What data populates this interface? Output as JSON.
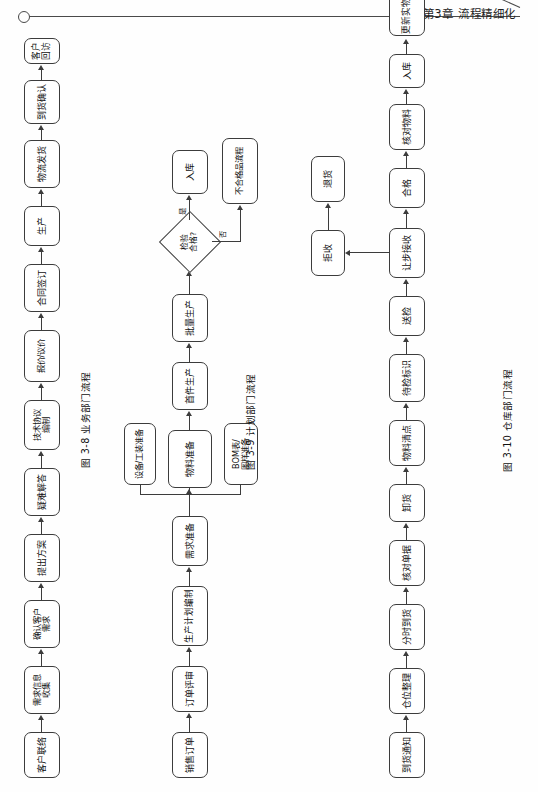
{
  "header": {
    "chapter_title": "第3章  流程精细化",
    "ornament_icon": "circle-ornament-icon",
    "rule_icon": "header-rule-icon"
  },
  "figures": [
    {
      "id": "fig-3-8",
      "caption": "图 3-8   业务部门流程",
      "caption_number": "图 3-8",
      "caption_name": "业务部门流程",
      "nodes": [
        {
          "key": "n1",
          "label": "客户联络"
        },
        {
          "key": "n2",
          "label": "需求信息\n收集"
        },
        {
          "key": "n3",
          "label": "确认客户\n需求"
        },
        {
          "key": "n4",
          "label": "提出方案"
        },
        {
          "key": "n5",
          "label": "疑难解答"
        },
        {
          "key": "n6",
          "label": "技术协议\n编制"
        },
        {
          "key": "n7",
          "label": "报价/议价"
        },
        {
          "key": "n8",
          "label": "合同签订"
        },
        {
          "key": "n9",
          "label": "生产"
        },
        {
          "key": "n10",
          "label": "物流发货"
        },
        {
          "key": "n11",
          "label": "到货确认"
        },
        {
          "key": "n12",
          "label": "客户回访"
        }
      ]
    },
    {
      "id": "fig-3-9",
      "caption": "图 3-9   计划部门流程",
      "caption_number": "图 3-9",
      "caption_name": "计划部门流程",
      "nodes": [
        {
          "key": "m1",
          "label": "销售订单"
        },
        {
          "key": "m2",
          "label": "订单评审"
        },
        {
          "key": "m3",
          "label": "生产计划编制"
        },
        {
          "key": "m4",
          "label": "需求准备"
        },
        {
          "key": "m5",
          "label": "物料准备"
        },
        {
          "key": "m6",
          "label": "设备/工装准备"
        },
        {
          "key": "m7",
          "label": "BOM表/\n图样准备"
        },
        {
          "key": "m8",
          "label": "首件生产"
        },
        {
          "key": "m9",
          "label": "批量生产"
        },
        {
          "key": "m10",
          "label": "入库"
        },
        {
          "key": "m11",
          "label": "不合格品流程"
        }
      ],
      "decision": {
        "key": "d1",
        "label": "检验\n合格?"
      },
      "edge_labels": {
        "yes": "是",
        "no": "否"
      }
    },
    {
      "id": "fig-3-10",
      "caption": "图 3-10   仓库部门流程",
      "caption_number": "图 3-10",
      "caption_name": "仓库部门流程",
      "nodes": [
        {
          "key": "w1",
          "label": "到货通知"
        },
        {
          "key": "w2",
          "label": "仓位整理"
        },
        {
          "key": "w3",
          "label": "分时到货"
        },
        {
          "key": "w4",
          "label": "核对单据"
        },
        {
          "key": "w5",
          "label": "卸货"
        },
        {
          "key": "w6",
          "label": "物料清点"
        },
        {
          "key": "w7",
          "label": "待检标识"
        },
        {
          "key": "w8",
          "label": "送检"
        },
        {
          "key": "w9",
          "label": "让步接收"
        },
        {
          "key": "w10",
          "label": "合格"
        },
        {
          "key": "w11",
          "label": "核对物料"
        },
        {
          "key": "w12",
          "label": "入库"
        },
        {
          "key": "w13",
          "label": "更新实物卡"
        },
        {
          "key": "w14",
          "label": "单据整理"
        },
        {
          "key": "w15",
          "label": "拒收"
        },
        {
          "key": "w16",
          "label": "退货"
        }
      ]
    }
  ],
  "colors": {
    "ink": "#3c3c3c",
    "text": "#111111",
    "paper": "#fefefe"
  }
}
